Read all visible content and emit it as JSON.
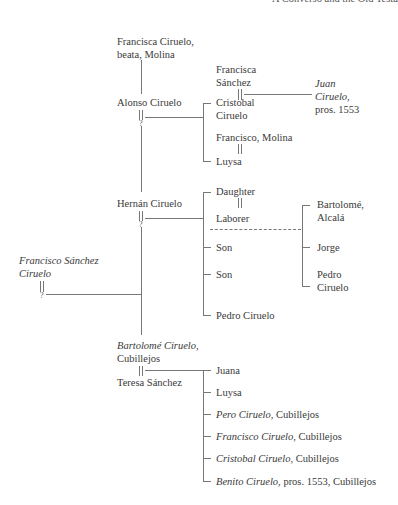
{
  "header": {
    "running_title": "A Converso and the Old Testa"
  },
  "tree": {
    "francisca_ciruelo": {
      "line1": "Francisca Ciruelo,",
      "line2": "beata, Molina"
    },
    "alonso": {
      "name": "Alonso Ciruelo",
      "spouse": "?"
    },
    "francisca_sanchez": {
      "line1": "Francisca",
      "line2": "Sánchez"
    },
    "juan": {
      "line1": "Juan",
      "line2": "Ciruelo,",
      "line3": "pros. 1553"
    },
    "cristobal": {
      "line1": "Cristobal",
      "line2": "Ciruelo"
    },
    "francisco_molina": {
      "name": "Francisco, Molina"
    },
    "luysa1": {
      "name": "Luysa"
    },
    "hernan": {
      "name": "Hernán Ciruelo",
      "spouse": "?"
    },
    "daughter": {
      "name": "Daughter"
    },
    "laborer": {
      "name": "Laborer"
    },
    "bartolome_alcala": {
      "line1": "Bartolomé,",
      "line2": "Alcalá"
    },
    "jorge": {
      "name": "Jorge"
    },
    "pedro_grandchild": {
      "line1": "Pedro",
      "line2": "Ciruelo"
    },
    "son1": {
      "name": "Son"
    },
    "son2": {
      "name": "Son"
    },
    "pedro_ciruelo": {
      "name": "Pedro Ciruelo"
    },
    "francisco_sanchez_ciruelo": {
      "line1": "Francisco Sánchez",
      "line2": "Ciruelo",
      "spouse": "?"
    },
    "bartolome_ciruelo": {
      "name_italic": "Bartolomé Ciruelo,",
      "place": "Cubillejos"
    },
    "teresa": {
      "name": "Teresa Sánchez"
    },
    "children_bartolome": [
      {
        "name": "Juana",
        "italic": "",
        "rest": ""
      },
      {
        "name": "Luysa",
        "italic": "",
        "rest": ""
      },
      {
        "name": "",
        "italic": "Pero Ciruelo,",
        "rest": " Cubillejos"
      },
      {
        "name": "",
        "italic": "Francisco Ciruelo,",
        "rest": " Cubillejos"
      },
      {
        "name": "",
        "italic": "Cristobal Ciruelo,",
        "rest": " Cubillejos"
      },
      {
        "name": "",
        "italic": "Benito Ciruelo,",
        "rest": " pros. 1553, Cubillejos"
      }
    ]
  }
}
